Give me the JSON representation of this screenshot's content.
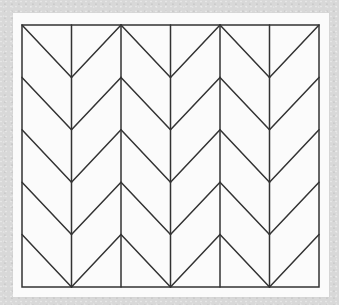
{
  "pattern": {
    "type": "herringbone-chevron",
    "columns": 6,
    "chevron_pairs": 3,
    "rows": 5,
    "line_color": "#333333",
    "paper_color": "#fbfbfb",
    "background_color": "#d8d8d8"
  }
}
